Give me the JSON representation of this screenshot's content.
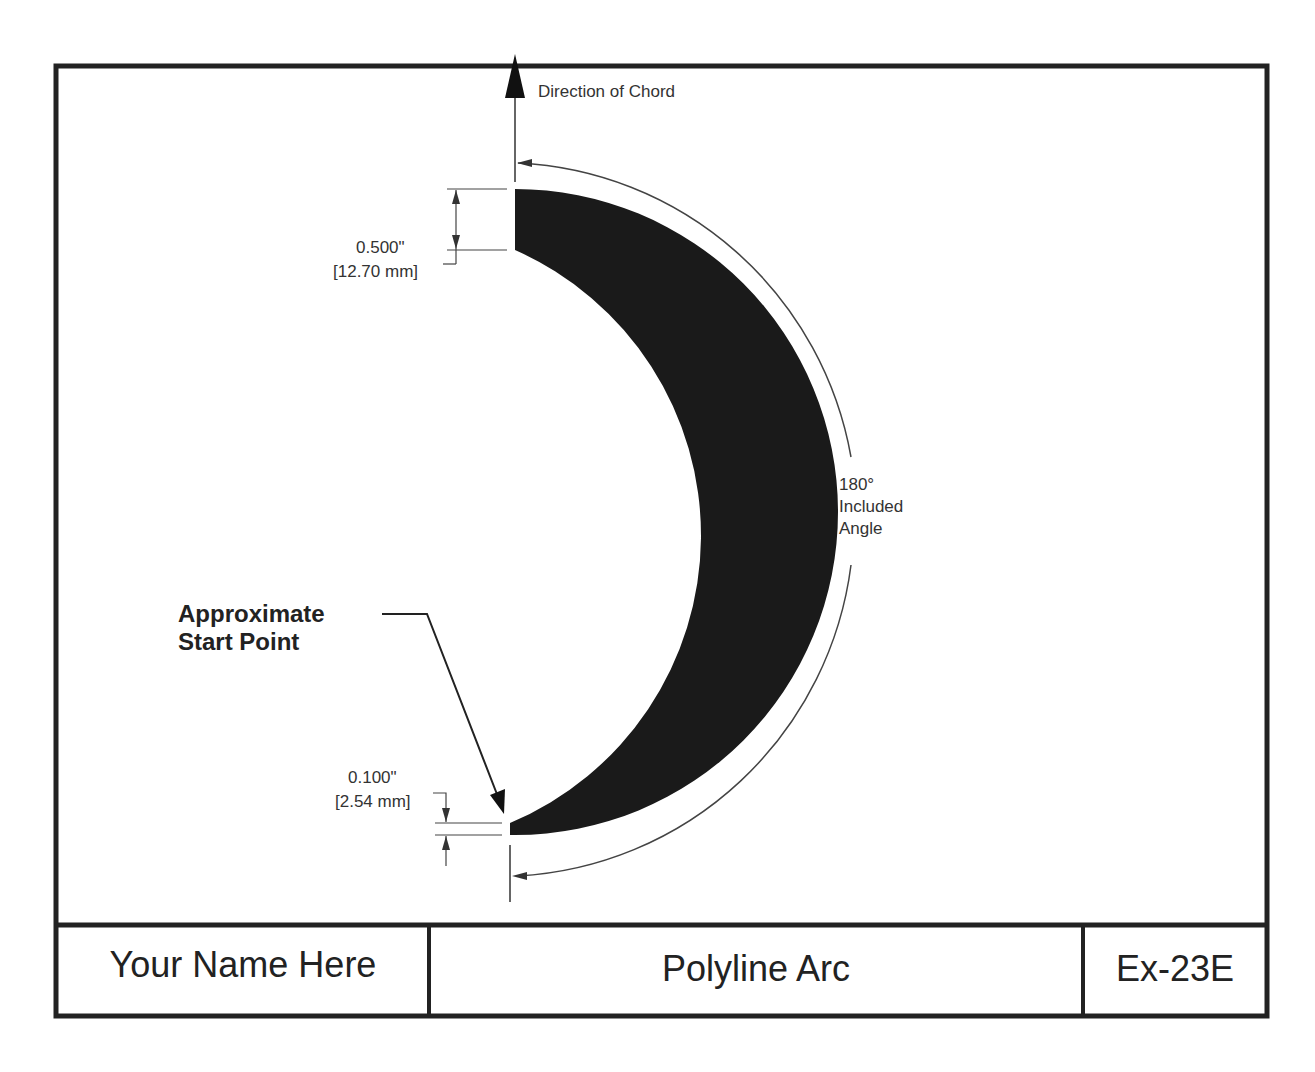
{
  "drawing": {
    "direction_label": "Direction of Chord",
    "start_width_dim": {
      "inch": "0.500\"",
      "mm": "[12.70 mm]"
    },
    "end_width_dim": {
      "inch": "0.100\"",
      "mm": "[2.54 mm]"
    },
    "angle_label": {
      "line1": "180°",
      "line2": "Included",
      "line3": "Angle"
    },
    "callout": {
      "line1": "Approximate",
      "line2": "Start Point"
    }
  },
  "title_block": {
    "name": "Your Name Here",
    "title": "Polyline Arc",
    "number": "Ex-23E"
  },
  "colors": {
    "ink": "#222222",
    "paper": "#ffffff"
  }
}
